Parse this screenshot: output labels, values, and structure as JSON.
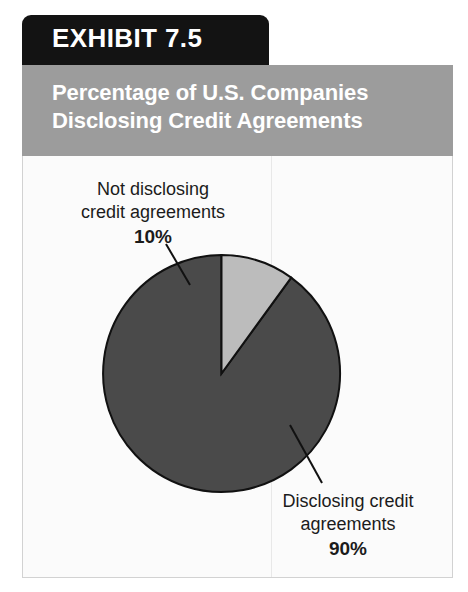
{
  "exhibit": {
    "tab_label": "EXHIBIT 7.5",
    "title_line_1": "Percentage of U.S. Companies",
    "title_line_2": "Disclosing Credit Agreements"
  },
  "colors": {
    "tab_background": "#131313",
    "title_band": "#9c9c9c",
    "panel_background": "#f2f2f2",
    "plot_background": "#fbfbfb",
    "slice_disclosing": "#4a4a4a",
    "slice_not_disclosing": "#bcbcbc",
    "outline": "#111111",
    "text": "#1b1b1b"
  },
  "callouts": {
    "not_disclosing": {
      "line_1": "Not disclosing",
      "line_2": "credit agreements",
      "percent": "10%"
    },
    "disclosing": {
      "line_1": "Disclosing credit",
      "line_2": "agreements",
      "percent": "90%"
    }
  },
  "chart_data": {
    "type": "pie",
    "title": "Percentage of U.S. Companies Disclosing Credit Agreements",
    "subtitle": "",
    "xlabel": "",
    "ylabel": "",
    "categories": [
      "Disclosing credit agreements",
      "Not disclosing credit agreements"
    ],
    "values": [
      90,
      10
    ],
    "value_unit": "%",
    "labels": [
      "90%",
      "10%"
    ],
    "colors": [
      "#4a4a4a",
      "#bcbcbc"
    ],
    "start_angle_deg": 90,
    "direction": "counterclockwise",
    "legend": false,
    "legend_position": "none",
    "grid": false,
    "annotations": [
      "Not disclosing credit agreements 10%",
      "Disclosing credit agreements 90%"
    ]
  }
}
